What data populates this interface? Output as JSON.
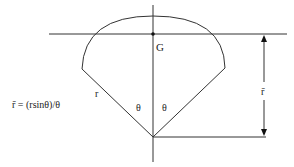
{
  "diagram": {
    "labels": {
      "centroid": "G",
      "radius": "r",
      "half_angle_left": "θ",
      "half_angle_right": "θ",
      "distance": "r̄",
      "formula": "r̄ = (rsinθ)/θ"
    },
    "colors": {
      "stroke": "#333333",
      "text": "#222222",
      "background": "#ffffff"
    }
  }
}
